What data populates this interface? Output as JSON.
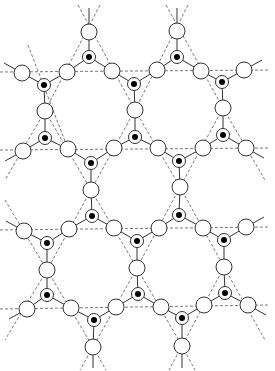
{
  "diagram": {
    "title": "",
    "colors": {
      "line": "#333333",
      "dash": "#555555",
      "open_fill": "#ffffff",
      "dot": "#000000"
    },
    "radii": {
      "open": 8,
      "ring": 6.5,
      "dot": 3
    },
    "open_nodes": [
      [
        89,
        32
      ],
      [
        177,
        31
      ],
      [
        22,
        73
      ],
      [
        67,
        72
      ],
      [
        112,
        71
      ],
      [
        157,
        70
      ],
      [
        201,
        71
      ],
      [
        244,
        70
      ],
      [
        45,
        111
      ],
      [
        135,
        110
      ],
      [
        223,
        108
      ],
      [
        23,
        151
      ],
      [
        68,
        149
      ],
      [
        114,
        148
      ],
      [
        158,
        148
      ],
      [
        203,
        148
      ],
      [
        246,
        148
      ],
      [
        91,
        190
      ],
      [
        180,
        187
      ],
      [
        24,
        231
      ],
      [
        69,
        229
      ],
      [
        114,
        228
      ],
      [
        159,
        228
      ],
      [
        203,
        228
      ],
      [
        246,
        227
      ],
      [
        47,
        270
      ],
      [
        137,
        268
      ],
      [
        224,
        267
      ],
      [
        27,
        309
      ],
      [
        71,
        308
      ],
      [
        116,
        307
      ],
      [
        161,
        307
      ],
      [
        204,
        305
      ],
      [
        248,
        305
      ],
      [
        93,
        347
      ],
      [
        182,
        346
      ]
    ],
    "filled_nodes": [
      [
        89,
        57
      ],
      [
        177,
        57
      ],
      [
        44,
        85
      ],
      [
        134,
        84
      ],
      [
        222,
        82
      ],
      [
        45,
        138
      ],
      [
        135,
        137
      ],
      [
        223,
        135
      ],
      [
        91,
        163
      ],
      [
        179,
        161
      ],
      [
        92,
        216
      ],
      [
        179,
        215
      ],
      [
        47,
        243
      ],
      [
        137,
        241
      ],
      [
        224,
        240
      ],
      [
        47,
        295
      ],
      [
        138,
        294
      ],
      [
        225,
        293
      ],
      [
        94,
        320
      ],
      [
        182,
        318
      ]
    ],
    "triangles": [
      {
        "center": [
          89,
          57
        ],
        "nodes": [
          [
            89,
            32
          ],
          [
            67,
            72
          ],
          [
            112,
            71
          ]
        ]
      },
      {
        "center": [
          177,
          57
        ],
        "nodes": [
          [
            177,
            31
          ],
          [
            157,
            70
          ],
          [
            201,
            71
          ]
        ]
      },
      {
        "center": [
          44,
          85
        ],
        "nodes": [
          [
            22,
            73
          ],
          [
            67,
            72
          ],
          [
            45,
            111
          ]
        ]
      },
      {
        "center": [
          134,
          84
        ],
        "nodes": [
          [
            112,
            71
          ],
          [
            157,
            70
          ],
          [
            135,
            110
          ]
        ]
      },
      {
        "center": [
          222,
          82
        ],
        "nodes": [
          [
            201,
            71
          ],
          [
            244,
            70
          ],
          [
            223,
            108
          ]
        ]
      },
      {
        "center": [
          45,
          138
        ],
        "nodes": [
          [
            45,
            111
          ],
          [
            23,
            151
          ],
          [
            68,
            149
          ]
        ]
      },
      {
        "center": [
          135,
          137
        ],
        "nodes": [
          [
            135,
            110
          ],
          [
            114,
            148
          ],
          [
            158,
            148
          ]
        ]
      },
      {
        "center": [
          223,
          135
        ],
        "nodes": [
          [
            223,
            108
          ],
          [
            203,
            148
          ],
          [
            246,
            148
          ]
        ]
      },
      {
        "center": [
          91,
          163
        ],
        "nodes": [
          [
            68,
            149
          ],
          [
            114,
            148
          ],
          [
            91,
            190
          ]
        ]
      },
      {
        "center": [
          179,
          161
        ],
        "nodes": [
          [
            158,
            148
          ],
          [
            203,
            148
          ],
          [
            180,
            187
          ]
        ]
      },
      {
        "center": [
          92,
          216
        ],
        "nodes": [
          [
            91,
            190
          ],
          [
            69,
            229
          ],
          [
            114,
            228
          ]
        ]
      },
      {
        "center": [
          179,
          215
        ],
        "nodes": [
          [
            180,
            187
          ],
          [
            159,
            228
          ],
          [
            203,
            228
          ]
        ]
      },
      {
        "center": [
          47,
          243
        ],
        "nodes": [
          [
            24,
            231
          ],
          [
            69,
            229
          ],
          [
            47,
            270
          ]
        ]
      },
      {
        "center": [
          137,
          241
        ],
        "nodes": [
          [
            114,
            228
          ],
          [
            159,
            228
          ],
          [
            137,
            268
          ]
        ]
      },
      {
        "center": [
          224,
          240
        ],
        "nodes": [
          [
            203,
            228
          ],
          [
            246,
            227
          ],
          [
            224,
            267
          ]
        ]
      },
      {
        "center": [
          47,
          295
        ],
        "nodes": [
          [
            47,
            270
          ],
          [
            27,
            309
          ],
          [
            71,
            308
          ]
        ]
      },
      {
        "center": [
          138,
          294
        ],
        "nodes": [
          [
            137,
            268
          ],
          [
            116,
            307
          ],
          [
            161,
            307
          ]
        ]
      },
      {
        "center": [
          225,
          293
        ],
        "nodes": [
          [
            224,
            267
          ],
          [
            204,
            305
          ],
          [
            248,
            305
          ]
        ]
      },
      {
        "center": [
          94,
          320
        ],
        "nodes": [
          [
            71,
            308
          ],
          [
            116,
            307
          ],
          [
            93,
            347
          ]
        ]
      },
      {
        "center": [
          182,
          318
        ],
        "nodes": [
          [
            161,
            307
          ],
          [
            204,
            305
          ],
          [
            182,
            346
          ]
        ]
      }
    ],
    "stubs": [
      [
        [
          89,
          32
        ],
        [
          89,
          8
        ]
      ],
      [
        [
          177,
          31
        ],
        [
          177,
          8
        ]
      ],
      [
        [
          22,
          73
        ],
        [
          4,
          63
        ]
      ],
      [
        [
          244,
          70
        ],
        [
          262,
          60
        ]
      ],
      [
        [
          23,
          151
        ],
        [
          5,
          161
        ]
      ],
      [
        [
          246,
          148
        ],
        [
          264,
          158
        ]
      ],
      [
        [
          24,
          231
        ],
        [
          6,
          221
        ]
      ],
      [
        [
          246,
          227
        ],
        [
          264,
          217
        ]
      ],
      [
        [
          27,
          309
        ],
        [
          9,
          319
        ]
      ],
      [
        [
          248,
          305
        ],
        [
          266,
          315
        ]
      ],
      [
        [
          93,
          347
        ],
        [
          93,
          368
        ]
      ],
      [
        [
          182,
          346
        ],
        [
          182,
          368
        ]
      ]
    ],
    "dashed_lines": [
      [
        [
          0,
          72
        ],
        [
          270,
          70
        ]
      ],
      [
        [
          0,
          150
        ],
        [
          270,
          148
        ]
      ],
      [
        [
          0,
          230
        ],
        [
          270,
          227
        ]
      ],
      [
        [
          0,
          309
        ],
        [
          270,
          305
        ]
      ],
      [
        [
          78,
          5
        ],
        [
          135,
          110
        ]
      ],
      [
        [
          100,
          5
        ],
        [
          45,
          111
        ]
      ],
      [
        [
          166,
          5
        ],
        [
          223,
          108
        ]
      ],
      [
        [
          188,
          5
        ],
        [
          135,
          110
        ]
      ],
      [
        [
          28,
          45
        ],
        [
          68,
          149
        ]
      ],
      [
        [
          45,
          111
        ],
        [
          5,
          180
        ]
      ],
      [
        [
          135,
          110
        ],
        [
          91,
          190
        ]
      ],
      [
        [
          135,
          110
        ],
        [
          180,
          187
        ]
      ],
      [
        [
          223,
          108
        ],
        [
          180,
          187
        ]
      ],
      [
        [
          223,
          108
        ],
        [
          265,
          180
        ]
      ],
      [
        [
          45,
          111
        ],
        [
          91,
          190
        ]
      ],
      [
        [
          91,
          190
        ],
        [
          47,
          270
        ]
      ],
      [
        [
          91,
          190
        ],
        [
          137,
          268
        ]
      ],
      [
        [
          180,
          187
        ],
        [
          137,
          268
        ]
      ],
      [
        [
          180,
          187
        ],
        [
          224,
          267
        ]
      ],
      [
        [
          224,
          267
        ],
        [
          265,
          340
        ]
      ],
      [
        [
          5,
          200
        ],
        [
          47,
          270
        ]
      ],
      [
        [
          47,
          270
        ],
        [
          5,
          340
        ]
      ],
      [
        [
          47,
          270
        ],
        [
          93,
          347
        ]
      ],
      [
        [
          137,
          268
        ],
        [
          93,
          347
        ]
      ],
      [
        [
          137,
          268
        ],
        [
          182,
          346
        ]
      ],
      [
        [
          224,
          267
        ],
        [
          182,
          346
        ]
      ],
      [
        [
          93,
          347
        ],
        [
          80,
          370
        ]
      ],
      [
        [
          93,
          347
        ],
        [
          106,
          370
        ]
      ],
      [
        [
          182,
          346
        ],
        [
          169,
          370
        ]
      ],
      [
        [
          182,
          346
        ],
        [
          195,
          370
        ]
      ]
    ]
  }
}
